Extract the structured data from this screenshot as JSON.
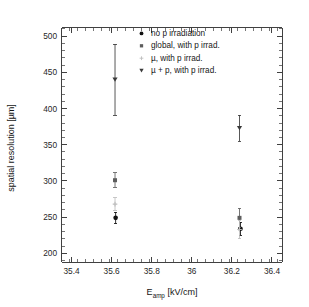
{
  "chart_data": {
    "type": "scatter",
    "title": "",
    "xlabel": "E_amp [kV/cm]",
    "xlabel_main": "E",
    "xlabel_subscript": "amp",
    "xlabel_units": "[kV/cm]",
    "ylabel": "spatial resolution [µm]",
    "xlim": [
      35.35,
      36.45
    ],
    "ylim": [
      188,
      512
    ],
    "x_ticks": [
      "35.4",
      "35.6",
      "35.8",
      "36",
      "36.2",
      "36.4"
    ],
    "x_tick_values": [
      35.4,
      35.6,
      35.8,
      36.0,
      36.2,
      36.4
    ],
    "x_minor_step": 0.04,
    "y_ticks": [
      "200",
      "250",
      "300",
      "350",
      "400",
      "450",
      "500"
    ],
    "y_tick_values": [
      200,
      250,
      300,
      350,
      400,
      450,
      500
    ],
    "y_minor_step": 10,
    "grid": false,
    "legend_position": "top-right-inside",
    "error_bars": "symmetric-vertical",
    "series": [
      {
        "name": "no p irradiation",
        "marker": "filled-circle",
        "color": "#111111",
        "x": [
          35.62,
          36.243
        ],
        "values": [
          249,
          234
        ],
        "yerr": [
          8,
          9
        ]
      },
      {
        "name": "global, with p irrad.",
        "marker": "filled-square",
        "color": "#5d5d5d",
        "x": [
          35.617,
          36.238
        ],
        "values": [
          301,
          249
        ],
        "yerr": [
          10,
          13
        ]
      },
      {
        "name": "µ, with p irrad.",
        "marker": "small-cross",
        "color": "#bdbdbd",
        "x": [
          35.617,
          36.238
        ],
        "values": [
          268,
          233
        ],
        "yerr": [
          9,
          13
        ]
      },
      {
        "name": "µ + p, with p irrad.",
        "marker": "filled-triangle-down",
        "color": "#3a3a3a",
        "x": [
          35.617,
          36.238
        ],
        "values": [
          440,
          373
        ],
        "yerr": [
          49,
          18
        ]
      }
    ]
  },
  "legend": {
    "entries": [
      {
        "label": "no p irradiation"
      },
      {
        "label": "global, with p irrad."
      },
      {
        "label": "µ, with p irrad."
      },
      {
        "label": "µ + p, with p irrad."
      }
    ]
  }
}
